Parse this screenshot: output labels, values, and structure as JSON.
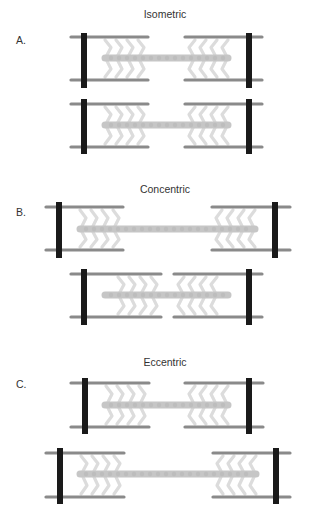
{
  "colors": {
    "z_line": "#1a1a1a",
    "actin": "#8a8a8a",
    "myosin": "#c6c6c6",
    "cross_bridge": "#dcdcdc",
    "text": "#333333"
  },
  "sections": [
    {
      "letter": "A.",
      "title": "Isometric",
      "title_pos": [
        165,
        8
      ],
      "letter_pos": [
        16,
        34
      ],
      "sarcomeres": [
        {
          "zl": 84,
          "zr": 249,
          "y_top": 37,
          "y_bot": 80,
          "z_top": 33,
          "z_bot": 88,
          "al": [
            71,
            148
          ],
          "ar": [
            185,
            262
          ],
          "my": [
            105,
            228
          ],
          "my_y": 58
        },
        {
          "zl": 84,
          "zr": 249,
          "y_top": 104,
          "y_bot": 147,
          "z_top": 99,
          "z_bot": 154,
          "al": [
            71,
            148
          ],
          "ar": [
            185,
            262
          ],
          "my": [
            105,
            228
          ],
          "my_y": 125
        }
      ]
    },
    {
      "letter": "B.",
      "title": "Concentric",
      "title_pos": [
        165,
        183
      ],
      "letter_pos": [
        16,
        206
      ],
      "sarcomeres": [
        {
          "zl": 59,
          "zr": 275,
          "y_top": 207,
          "y_bot": 250,
          "z_top": 202,
          "z_bot": 258,
          "al": [
            46,
            123
          ],
          "ar": [
            212,
            290
          ],
          "my": [
            80,
            255
          ],
          "my_y": 229
        },
        {
          "zl": 84,
          "zr": 249,
          "y_top": 274,
          "y_bot": 317,
          "z_top": 269,
          "z_bot": 325,
          "al": [
            71,
            161
          ],
          "ar": [
            174,
            262
          ],
          "my": [
            105,
            228
          ],
          "my_y": 295
        }
      ]
    },
    {
      "letter": "C.",
      "title": "Eccentric",
      "title_pos": [
        165,
        356
      ],
      "letter_pos": [
        16,
        378
      ],
      "sarcomeres": [
        {
          "zl": 85,
          "zr": 249,
          "y_top": 383,
          "y_bot": 427,
          "z_top": 378,
          "z_bot": 434,
          "al": [
            71,
            149
          ],
          "ar": [
            185,
            263
          ],
          "my": [
            105,
            228
          ],
          "my_y": 405
        },
        {
          "zl": 60,
          "zr": 276,
          "y_top": 453,
          "y_bot": 497,
          "z_top": 448,
          "z_bot": 504,
          "al": [
            46,
            124
          ],
          "ar": [
            213,
            290
          ],
          "my": [
            80,
            256
          ],
          "my_y": 474
        }
      ]
    }
  ]
}
